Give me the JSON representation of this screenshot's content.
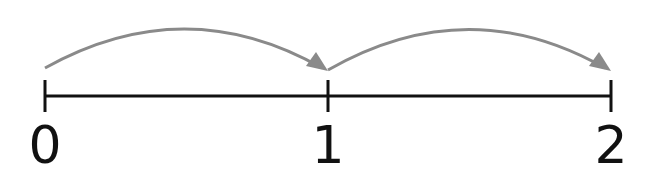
{
  "diagram": {
    "type": "number-line",
    "line_color": "#111111",
    "arrow_color": "#8a8a8a",
    "ticks": [
      {
        "value": "0",
        "x": 45
      },
      {
        "value": "1",
        "x": 328
      },
      {
        "value": "2",
        "x": 611
      }
    ],
    "jumps": [
      {
        "from": "0",
        "to": "1"
      },
      {
        "from": "1",
        "to": "2"
      }
    ]
  }
}
